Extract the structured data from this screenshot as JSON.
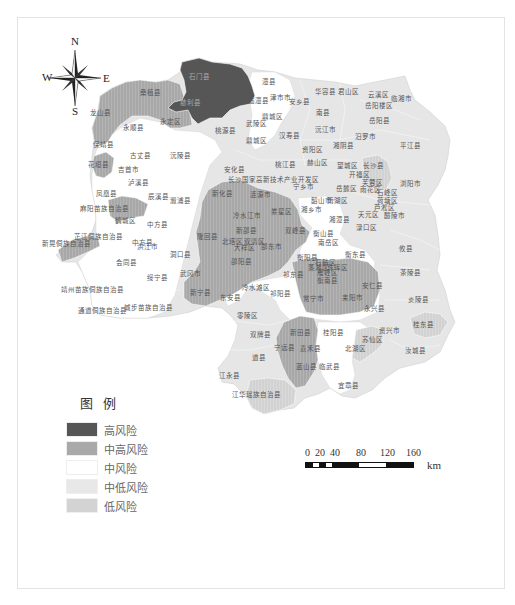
{
  "map": {
    "colors": {
      "high": "#5a5a5a",
      "mid_high": "#a9a9a9",
      "mid": "#ffffff",
      "mid_low": "#e6e6e6",
      "low": "#d3d3d3",
      "border": "#ffffff",
      "outline": "#cfcfcf"
    },
    "compass": {
      "north": "N",
      "south": "S",
      "east": "E",
      "west": "W"
    },
    "legend": {
      "title": "图例",
      "items": [
        {
          "label": "高风险",
          "color": "#5a5a5a",
          "level": "high"
        },
        {
          "label": "中高风险",
          "color": "#a9a9a9",
          "level": "mid_high"
        },
        {
          "label": "中风险",
          "color": "#ffffff",
          "level": "mid"
        },
        {
          "label": "中低风险",
          "color": "#e6e6e6",
          "level": "mid_low"
        },
        {
          "label": "低风险",
          "color": "#d3d3d3",
          "level": "low"
        }
      ]
    },
    "scale": {
      "ticks": [
        "0",
        "20",
        "40",
        "80",
        "120",
        "160"
      ],
      "unit": "km"
    },
    "regions": [
      {
        "name": "石门县",
        "x": 199,
        "y": 77,
        "risk": "high"
      },
      {
        "name": "慈利县",
        "x": 190,
        "y": 103,
        "risk": "high"
      },
      {
        "name": "桑植县",
        "x": 150,
        "y": 93,
        "risk": "mid_high"
      },
      {
        "name": "龙山县",
        "x": 100,
        "y": 113,
        "risk": "mid_high"
      },
      {
        "name": "永定区",
        "x": 170,
        "y": 122,
        "risk": "mid_high"
      },
      {
        "name": "永顺县",
        "x": 133,
        "y": 128,
        "risk": "mid"
      },
      {
        "name": "澧县",
        "x": 268,
        "y": 82,
        "risk": "mid"
      },
      {
        "name": "津市市",
        "x": 280,
        "y": 98,
        "risk": "mid"
      },
      {
        "name": "临澧县",
        "x": 258,
        "y": 101,
        "risk": "mid"
      },
      {
        "name": "安乡县",
        "x": 299,
        "y": 102,
        "risk": "mid_low"
      },
      {
        "name": "华容县",
        "x": 325,
        "y": 92,
        "risk": "mid_low"
      },
      {
        "name": "君山区",
        "x": 348,
        "y": 92,
        "risk": "mid_low"
      },
      {
        "name": "云溪区",
        "x": 378,
        "y": 95,
        "risk": "mid_low"
      },
      {
        "name": "临湘市",
        "x": 401,
        "y": 99,
        "risk": "mid_low"
      },
      {
        "name": "岳阳楼区",
        "x": 378,
        "y": 106,
        "risk": "mid_low"
      },
      {
        "name": "南县",
        "x": 322,
        "y": 113,
        "risk": "mid_low"
      },
      {
        "name": "鼎城区",
        "x": 272,
        "y": 117,
        "risk": "mid"
      },
      {
        "name": "武陵区",
        "x": 256,
        "y": 124,
        "risk": "mid"
      },
      {
        "name": "岳阳县",
        "x": 379,
        "y": 121,
        "risk": "mid_low"
      },
      {
        "name": "桃源县",
        "x": 225,
        "y": 131,
        "risk": "mid_low"
      },
      {
        "name": "沅江市",
        "x": 325,
        "y": 130,
        "risk": "mid_low"
      },
      {
        "name": "汉寿县",
        "x": 289,
        "y": 136,
        "risk": "mid_low"
      },
      {
        "name": "鼎城区",
        "x": 256,
        "y": 141,
        "risk": "mid",
        "id": "dingcheng-2"
      },
      {
        "name": "汨罗市",
        "x": 365,
        "y": 137,
        "risk": "mid_low"
      },
      {
        "name": "平江县",
        "x": 410,
        "y": 146,
        "risk": "mid_low"
      },
      {
        "name": "资阳区",
        "x": 312,
        "y": 150,
        "risk": "mid_low"
      },
      {
        "name": "湘阴县",
        "x": 343,
        "y": 146,
        "risk": "mid_low"
      },
      {
        "name": "保靖县",
        "x": 103,
        "y": 145,
        "risk": "mid"
      },
      {
        "name": "古丈县",
        "x": 140,
        "y": 156,
        "risk": "mid"
      },
      {
        "name": "沅陵县",
        "x": 180,
        "y": 156,
        "risk": "mid"
      },
      {
        "name": "花垣县",
        "x": 98,
        "y": 165,
        "risk": "mid_high"
      },
      {
        "name": "吉首市",
        "x": 128,
        "y": 170,
        "risk": "mid"
      },
      {
        "name": "桃江县",
        "x": 285,
        "y": 165,
        "risk": "mid_low"
      },
      {
        "name": "赫山区",
        "x": 317,
        "y": 163,
        "risk": "mid_low"
      },
      {
        "name": "安化县",
        "x": 234,
        "y": 170,
        "risk": "mid_low"
      },
      {
        "name": "望城区",
        "x": 347,
        "y": 166,
        "risk": "mid_low"
      },
      {
        "name": "长沙县",
        "x": 373,
        "y": 166,
        "risk": "low"
      },
      {
        "name": "开福区",
        "x": 359,
        "y": 175,
        "risk": "mid_low"
      },
      {
        "name": "长沙国家高新技术产业开发区",
        "x": 270,
        "y": 180,
        "risk": "mid_low"
      },
      {
        "name": "宁乡市",
        "x": 303,
        "y": 187,
        "risk": "mid_low"
      },
      {
        "name": "泸溪县",
        "x": 138,
        "y": 183,
        "risk": "mid"
      },
      {
        "name": "浏阳市",
        "x": 410,
        "y": 184,
        "risk": "mid_low"
      },
      {
        "name": "芙蓉区",
        "x": 372,
        "y": 183,
        "risk": "mid_low"
      },
      {
        "name": "岳麓区",
        "x": 346,
        "y": 189,
        "risk": "mid_low"
      },
      {
        "name": "雨花区",
        "x": 370,
        "y": 190,
        "risk": "mid_low"
      },
      {
        "name": "凤凰县",
        "x": 106,
        "y": 194,
        "risk": "mid"
      },
      {
        "name": "辰溪县",
        "x": 158,
        "y": 197,
        "risk": "mid"
      },
      {
        "name": "溆浦县",
        "x": 180,
        "y": 201,
        "risk": "mid"
      },
      {
        "name": "石峰区",
        "x": 387,
        "y": 193,
        "risk": "mid_low"
      },
      {
        "name": "新化县",
        "x": 222,
        "y": 194,
        "risk": "mid_high"
      },
      {
        "name": "涟源市",
        "x": 260,
        "y": 195,
        "risk": "mid_high"
      },
      {
        "name": "韶山市",
        "x": 321,
        "y": 201,
        "risk": "mid_low"
      },
      {
        "name": "雨湖区",
        "x": 337,
        "y": 201,
        "risk": "mid_low"
      },
      {
        "name": "荷塘区",
        "x": 387,
        "y": 201,
        "risk": "mid_low"
      },
      {
        "name": "麻阳苗族自治县",
        "x": 102,
        "y": 209,
        "risk": "mid_high"
      },
      {
        "name": "娄星区",
        "x": 281,
        "y": 212,
        "risk": "mid_high"
      },
      {
        "name": "湘乡市",
        "x": 311,
        "y": 210,
        "risk": "mid"
      },
      {
        "name": "芦淞区",
        "x": 384,
        "y": 208,
        "risk": "mid_low"
      },
      {
        "name": "冷水江市",
        "x": 246,
        "y": 216,
        "risk": "mid_high"
      },
      {
        "name": "鹤城区",
        "x": 125,
        "y": 221,
        "risk": "mid"
      },
      {
        "name": "中方县",
        "x": 157,
        "y": 225,
        "risk": "mid"
      },
      {
        "name": "湘潭县",
        "x": 339,
        "y": 220,
        "risk": "mid_low"
      },
      {
        "name": "天元区",
        "x": 368,
        "y": 215,
        "risk": "mid_low"
      },
      {
        "name": "醴陵市",
        "x": 394,
        "y": 216,
        "risk": "mid_low"
      },
      {
        "name": "渌口区",
        "x": 366,
        "y": 228,
        "risk": "mid_low"
      },
      {
        "name": "新邵县",
        "x": 246,
        "y": 231,
        "risk": "mid_high"
      },
      {
        "name": "双峰县",
        "x": 295,
        "y": 231,
        "risk": "mid_high"
      },
      {
        "name": "芷江侗族自治县",
        "x": 96,
        "y": 237,
        "risk": "mid"
      },
      {
        "name": "中方县",
        "x": 142,
        "y": 243,
        "risk": "mid",
        "id": "zhongfang-2"
      },
      {
        "name": "新晃侗族自治县",
        "x": 64,
        "y": 244,
        "risk": "mid_high"
      },
      {
        "name": "洪江市",
        "x": 147,
        "y": 247,
        "risk": "mid"
      },
      {
        "name": "隆回县",
        "x": 207,
        "y": 237,
        "risk": "mid_high"
      },
      {
        "name": "北塔区",
        "x": 232,
        "y": 242,
        "risk": "mid_high"
      },
      {
        "name": "双清区",
        "x": 254,
        "y": 242,
        "risk": "mid_high"
      },
      {
        "name": "大祥区",
        "x": 244,
        "y": 248,
        "risk": "mid_high"
      },
      {
        "name": "邵东市",
        "x": 271,
        "y": 247,
        "risk": "mid_high"
      },
      {
        "name": "南岳区",
        "x": 328,
        "y": 243,
        "risk": "mid"
      },
      {
        "name": "衡山县",
        "x": 323,
        "y": 234,
        "risk": "mid"
      },
      {
        "name": "攸县",
        "x": 405,
        "y": 249,
        "risk": "mid_low"
      },
      {
        "name": "衡阳县",
        "x": 307,
        "y": 258,
        "risk": "mid"
      },
      {
        "name": "衡东县",
        "x": 355,
        "y": 255,
        "risk": "mid"
      },
      {
        "name": "洞口县",
        "x": 180,
        "y": 255,
        "risk": "mid"
      },
      {
        "name": "邵阳县",
        "x": 241,
        "y": 262,
        "risk": "mid_high"
      },
      {
        "name": "会同县",
        "x": 126,
        "y": 263,
        "risk": "mid"
      },
      {
        "name": "石鼓区",
        "x": 325,
        "y": 263,
        "risk": "mid_high"
      },
      {
        "name": "蒸湘区",
        "x": 318,
        "y": 268,
        "risk": "mid_high"
      },
      {
        "name": "珠晖区",
        "x": 337,
        "y": 268,
        "risk": "mid_high"
      },
      {
        "name": "雁峰区",
        "x": 327,
        "y": 273,
        "risk": "mid_high"
      },
      {
        "name": "茶陵县",
        "x": 410,
        "y": 273,
        "risk": "mid_low"
      },
      {
        "name": "武冈市",
        "x": 190,
        "y": 274,
        "risk": "mid_high"
      },
      {
        "name": "绥宁县",
        "x": 157,
        "y": 278,
        "risk": "mid"
      },
      {
        "name": "祁东县",
        "x": 293,
        "y": 275,
        "risk": "mid_high"
      },
      {
        "name": "衡南县",
        "x": 327,
        "y": 281,
        "risk": "mid_high"
      },
      {
        "name": "安仁县",
        "x": 372,
        "y": 286,
        "risk": "mid"
      },
      {
        "name": "靖州苗族侗族自治县",
        "x": 90,
        "y": 290,
        "risk": "mid"
      },
      {
        "name": "新宁县",
        "x": 200,
        "y": 293,
        "risk": "mid_high"
      },
      {
        "name": "东安县",
        "x": 230,
        "y": 298,
        "risk": "mid"
      },
      {
        "name": "冷水滩区",
        "x": 255,
        "y": 288,
        "risk": "mid_low"
      },
      {
        "name": "祁阳县",
        "x": 280,
        "y": 294,
        "risk": "mid"
      },
      {
        "name": "常宁市",
        "x": 313,
        "y": 299,
        "risk": "mid_high"
      },
      {
        "name": "耒阳市",
        "x": 352,
        "y": 298,
        "risk": "mid_high"
      },
      {
        "name": "炎陵县",
        "x": 418,
        "y": 300,
        "risk": "mid_low"
      },
      {
        "name": "通道侗族自治县",
        "x": 100,
        "y": 311,
        "risk": "mid"
      },
      {
        "name": "城步苗族自治县",
        "x": 146,
        "y": 308,
        "risk": "mid"
      },
      {
        "name": "零陵区",
        "x": 247,
        "y": 316,
        "risk": "mid_low"
      },
      {
        "name": "永兴县",
        "x": 374,
        "y": 309,
        "risk": "mid"
      },
      {
        "name": "资兴市",
        "x": 389,
        "y": 331,
        "risk": "mid_low"
      },
      {
        "name": "桂东县",
        "x": 423,
        "y": 325,
        "risk": "low"
      },
      {
        "name": "双牌县",
        "x": 260,
        "y": 335,
        "risk": "mid_low"
      },
      {
        "name": "新田县",
        "x": 300,
        "y": 333,
        "risk": "mid_high"
      },
      {
        "name": "桂阳县",
        "x": 333,
        "y": 333,
        "risk": "mid"
      },
      {
        "name": "苏仙区",
        "x": 372,
        "y": 340,
        "risk": "low"
      },
      {
        "name": "宁远县",
        "x": 284,
        "y": 348,
        "risk": "mid_high"
      },
      {
        "name": "嘉禾县",
        "x": 310,
        "y": 349,
        "risk": "mid"
      },
      {
        "name": "北湖区",
        "x": 355,
        "y": 349,
        "risk": "low"
      },
      {
        "name": "汝城县",
        "x": 415,
        "y": 351,
        "risk": "mid_low"
      },
      {
        "name": "道县",
        "x": 258,
        "y": 358,
        "risk": "mid_low"
      },
      {
        "name": "蓝山县",
        "x": 306,
        "y": 367,
        "risk": "mid_high"
      },
      {
        "name": "临武县",
        "x": 329,
        "y": 367,
        "risk": "mid"
      },
      {
        "name": "江永县",
        "x": 229,
        "y": 376,
        "risk": "mid_low"
      },
      {
        "name": "宜章县",
        "x": 348,
        "y": 386,
        "risk": "mid"
      },
      {
        "name": "江华瑶族自治县",
        "x": 254,
        "y": 395,
        "risk": "low"
      }
    ]
  }
}
